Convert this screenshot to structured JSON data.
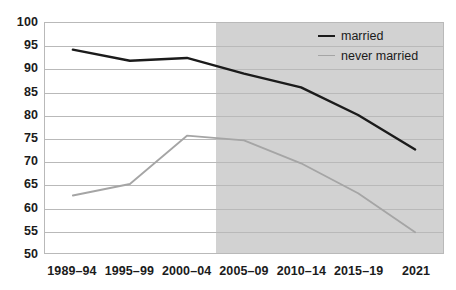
{
  "chart_data": {
    "type": "line",
    "title": "",
    "subtitle": "",
    "xlabel": "",
    "ylabel": "",
    "categories": [
      "1989–94",
      "1995–99",
      "2000–04",
      "2005–09",
      "2010–14",
      "2015–19",
      "2021"
    ],
    "ylim": [
      50,
      100
    ],
    "yticks": [
      50,
      55,
      60,
      65,
      70,
      75,
      80,
      85,
      90,
      95,
      100
    ],
    "ytick_labels": [
      "50",
      "55",
      "60",
      "65",
      "70",
      "75",
      "80",
      "85",
      "90",
      "95",
      "100"
    ],
    "grid": true,
    "legend_position": "top-right",
    "series": [
      {
        "name": "married",
        "color": "#1b1b1b",
        "width": 2.4,
        "values": [
          94.2,
          91.8,
          92.4,
          89.0,
          86.0,
          80.0,
          72.5
        ]
      },
      {
        "name": "never married",
        "color": "#a5a5a5",
        "width": 1.8,
        "values": [
          62.5,
          65.0,
          75.5,
          74.5,
          69.5,
          63.0,
          54.5
        ]
      }
    ],
    "shaded_region": {
      "from_category": "2005–09",
      "to_category": "2021",
      "color": "#d2d2d2"
    },
    "plot_background": "#ffffff",
    "grid_color": "#b9b9b9",
    "axis_color": "#b9b9b9"
  },
  "legend": {
    "items": [
      {
        "label": "married",
        "color": "#1b1b1b",
        "width": 2.4
      },
      {
        "label": "never married",
        "color": "#a5a5a5",
        "width": 1.8
      }
    ]
  }
}
